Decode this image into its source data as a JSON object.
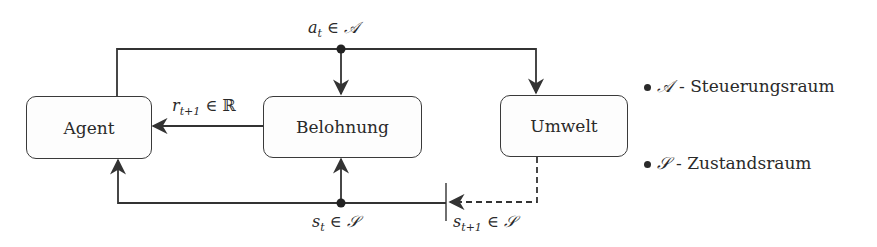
{
  "nodes": {
    "agent": "Agent",
    "reward": "Belohnung",
    "environment": "Umwelt"
  },
  "edges": {
    "action": {
      "var": "a",
      "sub": "t",
      "rel": " ∈ ",
      "set": "𝒜"
    },
    "reward": {
      "var": "r",
      "sub": "t+1",
      "rel": " ∈ ",
      "set": "ℝ"
    },
    "state": {
      "var": "s",
      "sub": "t",
      "rel": " ∈ ",
      "set": "𝒮"
    },
    "next_state": {
      "var": "s",
      "sub": "t+1",
      "rel": " ∈ ",
      "set": "𝒮"
    }
  },
  "legend": [
    {
      "symbol": "𝒜",
      "text": "- Steuerungsraum"
    },
    {
      "symbol": "𝒮",
      "text": "- Zustandsraum"
    }
  ],
  "colors": {
    "line": "#333333",
    "background": "#ffffff"
  }
}
